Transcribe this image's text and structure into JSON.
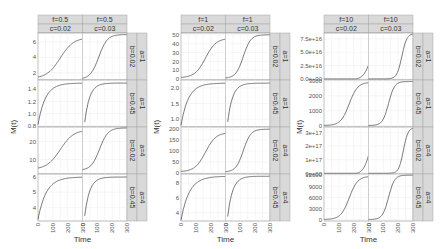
{
  "figure": {
    "ylabel": "M(t)",
    "xlabel": "Time",
    "x_ticks": [
      "0",
      "100",
      "200",
      "300"
    ],
    "strip_fill": "#d9d9d9",
    "strip_border": "#a6a6a6",
    "grid_color": "#ececec",
    "line_color": "#555555"
  },
  "chart_data": [
    {
      "type": "line",
      "title": "f=0.5",
      "xlabel": "Time",
      "ylabel": "M(t)",
      "xlim": [
        0,
        300
      ],
      "columns": [
        {
          "f": "f=0.5",
          "c": "c=0.02"
        },
        {
          "f": "f=0.5",
          "c": "c=0.03"
        }
      ],
      "rows": [
        {
          "a": "a=1",
          "b": "b=0.02",
          "ticks": [
            2,
            4,
            6
          ],
          "ylim": [
            1.0,
            7.2
          ],
          "series": [
            {
              "name": "c=0.02",
              "start": 1.2,
              "end": 6.6,
              "mid": 150,
              "k": 0.022
            },
            {
              "name": "c=0.03",
              "start": 1.1,
              "end": 7.0,
              "mid": 110,
              "k": 0.035
            }
          ]
        },
        {
          "a": "a=1",
          "b": "b=0.45",
          "ticks": [
            0.8,
            1.0,
            1.2,
            1.4
          ],
          "tick_labels": [
            "0.8",
            "1.0",
            "1.2",
            "1.4"
          ],
          "ylim": [
            0.78,
            1.55
          ],
          "series": [
            {
              "name": "c=0.02",
              "start": 0.82,
              "end": 1.5,
              "shape": "sat",
              "k": 0.02
            },
            {
              "name": "c=0.03",
              "start": 0.8,
              "end": 1.5,
              "shape": "sat",
              "k": 0.03,
              "x0": 12
            }
          ]
        },
        {
          "a": "a=4",
          "b": "b=0.02",
          "ticks": [
            10,
            20
          ],
          "ylim": [
            2,
            28
          ],
          "series": [
            {
              "name": "c=0.02",
              "start": 4.5,
              "end": 26.5,
              "mid": 150,
              "k": 0.022
            },
            {
              "name": "c=0.03",
              "start": 4.0,
              "end": 27.5,
              "mid": 115,
              "k": 0.035
            }
          ]
        },
        {
          "a": "a=4",
          "b": "b=0.45",
          "ticks": [
            4,
            5,
            6
          ],
          "ylim": [
            3.1,
            6.2
          ],
          "series": [
            {
              "name": "c=0.02",
              "start": 3.2,
              "end": 6.0,
              "shape": "sat",
              "k": 0.018
            },
            {
              "name": "c=0.03",
              "start": 3.2,
              "end": 6.0,
              "shape": "sat",
              "k": 0.03,
              "x0": 12
            }
          ]
        }
      ]
    },
    {
      "type": "line",
      "title": "f=1",
      "xlabel": "Time",
      "ylabel": "M(t)",
      "xlim": [
        0,
        300
      ],
      "columns": [
        {
          "f": "f=1",
          "c": "c=0.02"
        },
        {
          "f": "f=1",
          "c": "c=0.03"
        }
      ],
      "rows": [
        {
          "a": "a=1",
          "b": "b=0.02",
          "ticks": [
            0,
            10,
            20,
            30,
            40,
            50
          ],
          "ylim": [
            -1,
            52
          ],
          "series": [
            {
              "name": "c=0.02",
              "start": 1.5,
              "end": 46,
              "mid": 165,
              "k": 0.028
            },
            {
              "name": "c=0.03",
              "start": 1.0,
              "end": 50,
              "mid": 120,
              "k": 0.04
            }
          ]
        },
        {
          "a": "a=1",
          "b": "b=0.45",
          "ticks": [
            1.0,
            1.5,
            2.0
          ],
          "tick_labels": [
            "1.0",
            "1.5",
            "2.0"
          ],
          "ylim": [
            0.75,
            2.25
          ],
          "series": [
            {
              "name": "c=0.02",
              "start": 0.8,
              "end": 2.15,
              "shape": "sat",
              "k": 0.02
            },
            {
              "name": "c=0.03",
              "start": 0.8,
              "end": 2.15,
              "shape": "sat",
              "k": 0.03,
              "x0": 12
            }
          ]
        },
        {
          "a": "a=4",
          "b": "b=0.02",
          "ticks": [
            0,
            50,
            100,
            150,
            200
          ],
          "ylim": [
            -5,
            210
          ],
          "series": [
            {
              "name": "c=0.02",
              "start": 5,
              "end": 185,
              "mid": 165,
              "k": 0.028
            },
            {
              "name": "c=0.03",
              "start": 4,
              "end": 200,
              "mid": 120,
              "k": 0.04
            }
          ]
        },
        {
          "a": "a=4",
          "b": "b=0.45",
          "ticks": [
            4,
            6,
            8
          ],
          "ylim": [
            2.9,
            9.2
          ],
          "series": [
            {
              "name": "c=0.02",
              "start": 3.0,
              "end": 8.9,
              "shape": "sat",
              "k": 0.018
            },
            {
              "name": "c=0.03",
              "start": 3.0,
              "end": 8.9,
              "shape": "sat",
              "k": 0.03,
              "x0": 12
            }
          ]
        }
      ]
    },
    {
      "type": "line",
      "title": "f=10",
      "xlabel": "Time",
      "ylabel": "M(t)",
      "xlim": [
        0,
        300
      ],
      "columns": [
        {
          "f": "f=10",
          "c": "c=0.02"
        },
        {
          "f": "f=10",
          "c": "c=0.03"
        }
      ],
      "rows": [
        {
          "a": "a=1",
          "b": "b=0.02",
          "ticks": [
            0,
            2.5e+16,
            5e+16,
            7.5e+16
          ],
          "tick_labels": [
            "0.0e+00",
            "2.5e+16",
            "5.0e+16",
            "7.5e+16"
          ],
          "ylim": [
            -2000000000000000.0,
            8.6e+16
          ],
          "series": [
            {
              "name": "c=0.02",
              "start": 0,
              "end": 2.6e+16,
              "shape": "exp",
              "x0": 195,
              "xend": 300
            },
            {
              "name": "c=0.03",
              "start": 0,
              "end": 8.5e+16,
              "mid": 225,
              "k": 0.06
            }
          ]
        },
        {
          "a": "a=1",
          "b": "b=0.45",
          "ticks": [
            0,
            1000,
            2000,
            3000
          ],
          "ylim": [
            -80,
            3050
          ],
          "series": [
            {
              "name": "c=0.02",
              "start": 20,
              "end": 2900,
              "mid": 170,
              "k": 0.035
            },
            {
              "name": "c=0.03",
              "start": 20,
              "end": 2950,
              "mid": 135,
              "k": 0.05
            }
          ]
        },
        {
          "a": "a=4",
          "b": "b=0.02",
          "ticks": [
            0,
            1e+17,
            2e+17,
            3e+17
          ],
          "tick_labels": [
            "0e+00",
            "1e+17",
            "2e+17",
            "3e+17"
          ],
          "ylim": [
            -5000000000000000.0,
            3.4e+17
          ],
          "series": [
            {
              "name": "c=0.02",
              "start": 0,
              "end": 1.3e+17,
              "shape": "exp",
              "x0": 200,
              "xend": 300
            },
            {
              "name": "c=0.03",
              "start": 0,
              "end": 3.35e+17,
              "mid": 235,
              "k": 0.065
            }
          ]
        },
        {
          "a": "a=4",
          "b": "b=0.45",
          "ticks": [
            0,
            3000,
            6000,
            9000,
            12000
          ],
          "ylim": [
            -300,
            12300
          ],
          "series": [
            {
              "name": "c=0.02",
              "start": 100,
              "end": 11700,
              "mid": 170,
              "k": 0.035
            },
            {
              "name": "c=0.03",
              "start": 100,
              "end": 12000,
              "mid": 135,
              "k": 0.05
            }
          ]
        }
      ]
    }
  ]
}
